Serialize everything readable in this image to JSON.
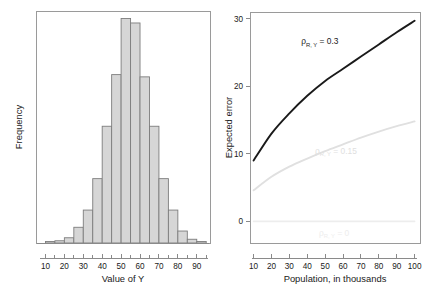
{
  "figure": {
    "width": 444,
    "height": 294,
    "background": "#ffffff"
  },
  "panels": [
    {
      "id": "histogram",
      "xlabel": "Value of Y",
      "ylabel": "Frequency"
    },
    {
      "id": "expected-error",
      "xlabel": "Population, in thousands",
      "ylabel": "Expected error"
    }
  ],
  "chart_data": [
    {
      "type": "bar",
      "id": "histogram",
      "title": "",
      "xlabel": "Value of Y",
      "ylabel": "Frequency",
      "xlim": [
        5,
        97
      ],
      "ylim": [
        0,
        31
      ],
      "grid": false,
      "legend": null,
      "bar_fill": "#d6d6d6",
      "bar_edge": "#7d7d7d",
      "bin_width": 5,
      "bin_starts": [
        10,
        15,
        20,
        25,
        30,
        35,
        40,
        45,
        50,
        55,
        60,
        65,
        70,
        75,
        80,
        85,
        90
      ],
      "categories": [
        "10-15",
        "15-20",
        "20-25",
        "25-30",
        "30-35",
        "35-40",
        "40-45",
        "45-50",
        "50-55",
        "55-60",
        "60-65",
        "65-70",
        "70-75",
        "75-80",
        "80-85",
        "85-90",
        "90-95"
      ],
      "values": [
        0.2,
        0.3,
        0.7,
        2.1,
        4.4,
        8.6,
        15.6,
        22.5,
        30.0,
        29.4,
        22.2,
        15.6,
        8.6,
        4.4,
        1.6,
        0.5,
        0.2
      ],
      "xticks_major": [
        10,
        20,
        30,
        40,
        50,
        60,
        70,
        80,
        90
      ],
      "xticks_minor": [
        15,
        25,
        35,
        45,
        55,
        65,
        75,
        85,
        95
      ],
      "xticklabels": [
        "10",
        "20",
        "30",
        "40",
        "50",
        "60",
        "70",
        "80",
        "90"
      ],
      "yticks": [],
      "yticklabels": []
    },
    {
      "type": "line",
      "id": "expected-error",
      "title": "",
      "xlabel": "Population, in thousands",
      "ylabel": "Expected error",
      "xlim": [
        8,
        103
      ],
      "ylim": [
        -3.2,
        31
      ],
      "grid": false,
      "legend": "inline-annotations",
      "x": [
        10,
        20,
        30,
        40,
        50,
        60,
        70,
        80,
        90,
        100
      ],
      "xticks": [
        10,
        20,
        30,
        40,
        50,
        60,
        70,
        80,
        90,
        100
      ],
      "xticklabels": [
        "10",
        "20",
        "30",
        "40",
        "50",
        "60",
        "70",
        "80",
        "90",
        "100"
      ],
      "yticks": [
        0,
        10,
        20,
        30
      ],
      "yticklabels": [
        "0",
        "10",
        "20",
        "30"
      ],
      "series": [
        {
          "name": "rho_RY = 0.3",
          "label": "ρ",
          "label_sub": "R, Y",
          "label_value": " = 0.3",
          "color": "#1a1a1a",
          "width": 1.9,
          "values": [
            9.0,
            13.0,
            16.0,
            18.6,
            20.8,
            22.6,
            24.4,
            26.2,
            28.0,
            29.7
          ],
          "annotation_x": 47,
          "annotation_y": 26.2
        },
        {
          "name": "rho_RY = 0.15",
          "label": "ρ",
          "label_sub": "R, Y",
          "label_value": " = 0.15",
          "color": "#e0e0e0",
          "width": 1.9,
          "values": [
            4.6,
            6.6,
            8.1,
            9.3,
            10.4,
            11.4,
            12.4,
            13.3,
            14.1,
            14.8
          ],
          "annotation_x": 56,
          "annotation_y": 10.0
        },
        {
          "name": "rho_RY = 0",
          "label": "ρ",
          "label_sub": "R, Y",
          "label_value": " = 0",
          "color": "#ededed",
          "width": 1.6,
          "values": [
            0,
            0,
            0,
            0,
            0,
            0,
            0,
            0,
            0,
            0
          ],
          "annotation_x": 55,
          "annotation_y": -2.2
        }
      ]
    }
  ]
}
